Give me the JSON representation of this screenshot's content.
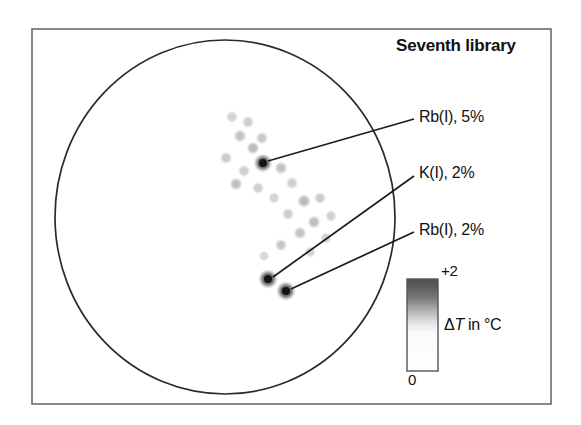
{
  "figure": {
    "title": "Seventh library",
    "frame": {
      "x": 32,
      "y": 29,
      "width": 519,
      "height": 375,
      "stroke": "#6b6b6b"
    },
    "wafer": {
      "name": "circular-library-wafer",
      "cx": 225,
      "cy": 217,
      "rx": 170,
      "ry": 177,
      "stroke": "#2b2b2b",
      "fill": "#ffffff"
    }
  },
  "annotations": [
    {
      "label": "Rb(I), 5%",
      "spot": {
        "x": 263,
        "y": 163
      },
      "leader_end": {
        "x": 414,
        "y": 119
      }
    },
    {
      "label": "K(I), 2%",
      "spot": {
        "x": 268,
        "y": 279
      },
      "leader_end": {
        "x": 414,
        "y": 176
      }
    },
    {
      "label": "Rb(I), 2%",
      "spot": {
        "x": 286,
        "y": 291
      },
      "leader_end": {
        "x": 414,
        "y": 232
      }
    }
  ],
  "colorbar": {
    "name": "delta-t-colorbar",
    "max_label": "+2",
    "min_label": "0",
    "unit_prefix": "Δ",
    "unit_italic": "T",
    "unit_suffix": " in °C",
    "unit_label": "ΔT in °C",
    "x": 407,
    "y": 279,
    "width": 31,
    "height": 92,
    "stroke": "#555555",
    "top_color": "#4f4f4f",
    "bottom_color": "#ffffff"
  },
  "chart_data": {
    "type": "heatmap",
    "title": "Seventh library",
    "xlabel": "",
    "ylabel": "",
    "colorbar_label": "ΔT in °C",
    "colorbar_range": [
      0,
      2
    ],
    "colorbar_tick_labels": [
      "0",
      "+2"
    ],
    "colormap": "white-to-darkgray",
    "grid": false,
    "legend_position": "right",
    "domain_shape": "circle",
    "points": [
      {
        "x": 263,
        "y": 163,
        "dT": 2.0,
        "r": 5.0,
        "label": "Rb(I), 5%"
      },
      {
        "x": 268,
        "y": 279,
        "dT": 2.0,
        "r": 5.2,
        "label": "K(I), 2%"
      },
      {
        "x": 286,
        "y": 291,
        "dT": 2.0,
        "r": 5.2,
        "label": "Rb(I), 2%"
      },
      {
        "x": 232,
        "y": 117,
        "dT": 0.25,
        "r": 3.4,
        "label": ""
      },
      {
        "x": 248,
        "y": 122,
        "dT": 0.3,
        "r": 3.4,
        "label": ""
      },
      {
        "x": 240,
        "y": 136,
        "dT": 0.45,
        "r": 3.6,
        "label": ""
      },
      {
        "x": 262,
        "y": 138,
        "dT": 0.4,
        "r": 3.4,
        "label": ""
      },
      {
        "x": 253,
        "y": 148,
        "dT": 0.55,
        "r": 3.6,
        "label": ""
      },
      {
        "x": 226,
        "y": 158,
        "dT": 0.35,
        "r": 3.4,
        "label": ""
      },
      {
        "x": 244,
        "y": 171,
        "dT": 0.3,
        "r": 3.4,
        "label": ""
      },
      {
        "x": 281,
        "y": 168,
        "dT": 0.45,
        "r": 3.6,
        "label": ""
      },
      {
        "x": 236,
        "y": 184,
        "dT": 0.5,
        "r": 3.6,
        "label": ""
      },
      {
        "x": 258,
        "y": 188,
        "dT": 0.3,
        "r": 3.4,
        "label": ""
      },
      {
        "x": 292,
        "y": 183,
        "dT": 0.3,
        "r": 3.4,
        "label": ""
      },
      {
        "x": 274,
        "y": 198,
        "dT": 0.25,
        "r": 3.2,
        "label": ""
      },
      {
        "x": 304,
        "y": 201,
        "dT": 0.55,
        "r": 3.8,
        "label": ""
      },
      {
        "x": 320,
        "y": 198,
        "dT": 0.35,
        "r": 3.4,
        "label": ""
      },
      {
        "x": 288,
        "y": 214,
        "dT": 0.3,
        "r": 3.4,
        "label": ""
      },
      {
        "x": 314,
        "y": 222,
        "dT": 0.5,
        "r": 3.6,
        "label": ""
      },
      {
        "x": 331,
        "y": 216,
        "dT": 0.3,
        "r": 3.2,
        "label": ""
      },
      {
        "x": 300,
        "y": 233,
        "dT": 0.45,
        "r": 3.6,
        "label": ""
      },
      {
        "x": 326,
        "y": 238,
        "dT": 0.3,
        "r": 3.2,
        "label": ""
      },
      {
        "x": 281,
        "y": 245,
        "dT": 0.4,
        "r": 3.4,
        "label": ""
      },
      {
        "x": 310,
        "y": 252,
        "dT": 0.25,
        "r": 3.2,
        "label": ""
      },
      {
        "x": 264,
        "y": 256,
        "dT": 0.22,
        "r": 3.0,
        "label": ""
      }
    ]
  }
}
